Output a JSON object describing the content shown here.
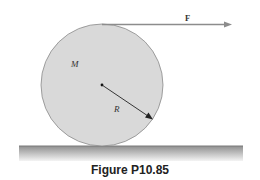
{
  "figure": {
    "caption": "Figure P10.85",
    "labels": {
      "force": "F",
      "mass": "M",
      "radius": "R"
    },
    "colors": {
      "disk_fill": "#d9d9d9",
      "disk_stroke": "#8a8a8a",
      "arrow": "#8c8c8c",
      "ground_top": "#8f8f8f",
      "ground_bottom": "#f2f2f2"
    }
  }
}
